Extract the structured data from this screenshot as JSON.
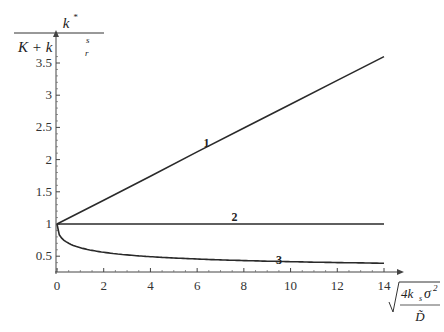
{
  "chart_data": {
    "type": "line",
    "title": "",
    "ylabel": "k* / (K + k_r^s)",
    "ylabel_parts": {
      "numerator": "k",
      "numerator_sup": "*",
      "denominator_K": "K + k",
      "denominator_sub": "r",
      "denominator_sup": "s"
    },
    "xlabel": "sqrt(4 k_s sigma^2 / D~)",
    "xlabel_parts": {
      "numerator": "4k",
      "numerator_sub": "s",
      "sigma": "σ",
      "sigma_sup": "2",
      "denominator": "D̃"
    },
    "xlim": [
      0,
      14
    ],
    "ylim": [
      0.2,
      3.7
    ],
    "x_ticks": [
      "0",
      "2",
      "4",
      "6",
      "8",
      "10",
      "12",
      "14"
    ],
    "y_ticks": [
      "0.5",
      "1",
      "1.5",
      "2",
      "2.5",
      "3",
      "3.5"
    ],
    "grid": false,
    "legend": "none (inline curve labels)",
    "series": [
      {
        "name": "1",
        "x": [
          0,
          2,
          4,
          6,
          8,
          10,
          12,
          14
        ],
        "values": [
          1.0,
          1.37,
          1.74,
          2.12,
          2.49,
          2.86,
          3.23,
          3.6
        ]
      },
      {
        "name": "2",
        "x": [
          0,
          2,
          4,
          6,
          8,
          10,
          12,
          14
        ],
        "values": [
          1.0,
          1.0,
          1.0,
          1.0,
          1.0,
          1.0,
          1.0,
          1.0
        ]
      },
      {
        "name": "3",
        "x": [
          0,
          0.5,
          1,
          2,
          4,
          6,
          8,
          10,
          12,
          14
        ],
        "values": [
          1.0,
          0.72,
          0.62,
          0.5,
          0.4,
          0.36,
          0.33,
          0.32,
          0.31,
          0.3
        ]
      }
    ],
    "curve_labels": [
      {
        "text": "1",
        "x": 6.4,
        "y": 2.2
      },
      {
        "text": "2",
        "x": 7.6,
        "y": 1.05
      },
      {
        "text": "3",
        "x": 9.5,
        "y": 0.38
      }
    ]
  },
  "colors": {
    "line": "#2a2a2a",
    "axis": "#444444",
    "background": "#ffffff"
  }
}
